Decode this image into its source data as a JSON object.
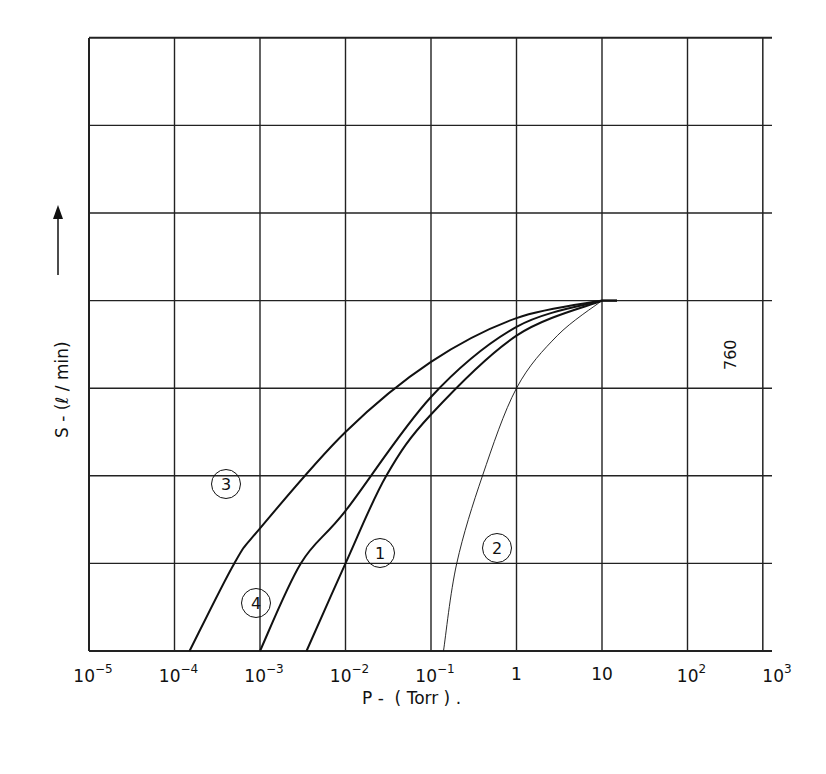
{
  "chart_data": {
    "type": "line",
    "title": "",
    "xlabel": "P -  ( Torr ) .",
    "ylabel": "S - (ℓ / min)",
    "xscale": "log",
    "xlim": [
      1e-05,
      1000.0
    ],
    "x_tick_labels": [
      {
        "base": "10",
        "exp": "−5"
      },
      {
        "base": "10",
        "exp": "−4"
      },
      {
        "base": "10",
        "exp": "−3"
      },
      {
        "base": "10",
        "exp": "−2"
      },
      {
        "base": "10",
        "exp": "−1"
      },
      {
        "base": "1",
        "exp": ""
      },
      {
        "base": "10",
        "exp": ""
      },
      {
        "base": "10",
        "exp": "2"
      },
      {
        "base": "10",
        "exp": "3"
      }
    ],
    "y_gridlines": 7,
    "y_tick_labels": [],
    "grid": true,
    "legend": "none",
    "annotation": "760",
    "annotation_x": 760,
    "plateau_start_x": 10,
    "plateau_level_gridline": 4,
    "series": [
      {
        "name": "1",
        "x": [
          0.0035,
          0.01,
          0.03,
          0.1,
          1,
          10
        ],
        "y_gridlines": [
          0,
          1,
          2,
          2.7,
          3.6,
          4
        ]
      },
      {
        "name": "2",
        "x": [
          0.14,
          0.2,
          0.4,
          1,
          3,
          10
        ],
        "y_gridlines": [
          0,
          1,
          2,
          3,
          3.6,
          4
        ]
      },
      {
        "name": "3",
        "x": [
          0.00015,
          0.0005,
          0.001,
          0.01,
          0.1,
          1,
          10
        ],
        "y_gridlines": [
          0,
          1,
          1.4,
          2.5,
          3.3,
          3.8,
          4
        ]
      },
      {
        "name": "4",
        "x": [
          0.001,
          0.003,
          0.01,
          0.1,
          1,
          10
        ],
        "y_gridlines": [
          0,
          1,
          1.6,
          2.9,
          3.7,
          4
        ]
      }
    ]
  },
  "labels": {
    "c1": "1",
    "c2": "2",
    "c3": "3",
    "c4": "4",
    "a760": "760"
  }
}
